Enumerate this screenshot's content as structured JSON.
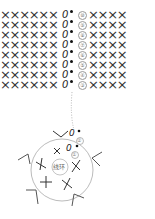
{
  "diagram": {
    "type": "crochet-chart",
    "rows": [
      {
        "number": "⑩",
        "left": "××××××",
        "turn": "0",
        "right": "××××"
      },
      {
        "number": "⑨",
        "left": "××××××",
        "turn": "0",
        "right": "××××"
      },
      {
        "number": "⑧",
        "left": "××××××",
        "turn": "0",
        "right": "××××"
      },
      {
        "number": "⑦",
        "left": "××××××",
        "turn": "0",
        "right": "××××"
      },
      {
        "number": "⑥",
        "left": "××××××",
        "turn": "0",
        "right": "××××"
      },
      {
        "number": "⑤",
        "left": "××××××",
        "turn": "0",
        "right": "××××"
      },
      {
        "number": "④",
        "left": "××××××",
        "turn": "0",
        "right": "××××"
      },
      {
        "number": "③",
        "left": "××××××",
        "turn": "0",
        "right": "××××"
      }
    ],
    "round2": {
      "number": "②",
      "turn": "0"
    },
    "round1": {
      "number": "①",
      "turn": "0",
      "stitch": "×"
    },
    "center_label": "线环",
    "colors": {
      "stroke": "#333333",
      "circle": "#999999",
      "number": "#888888"
    }
  }
}
